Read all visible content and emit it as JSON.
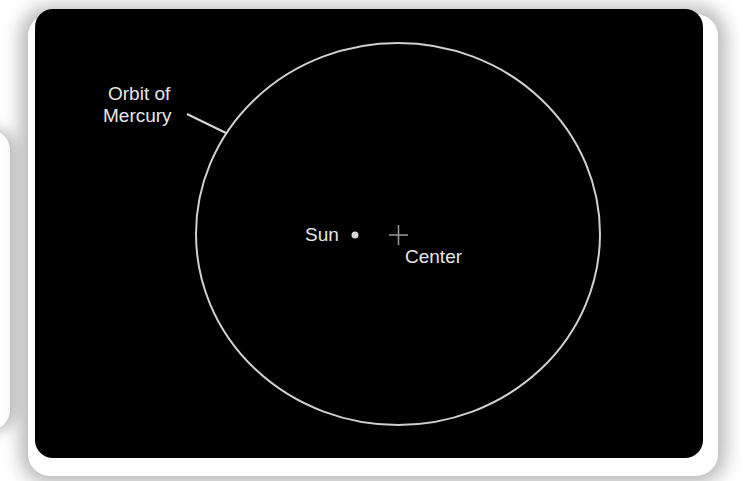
{
  "diagram": {
    "background_color": "#000000",
    "orbit": {
      "label_line1": "Orbit of",
      "label_line2": "Mercury",
      "center_x": 398,
      "center_y": 234,
      "rx": 202,
      "ry": 191,
      "stroke": "#d0d0d0"
    },
    "sun": {
      "label": "Sun",
      "x": 355,
      "y": 235,
      "color": "#d8d8d8"
    },
    "center": {
      "label": "Center",
      "x": 398,
      "y": 235,
      "color": "#9a9a9a"
    }
  }
}
